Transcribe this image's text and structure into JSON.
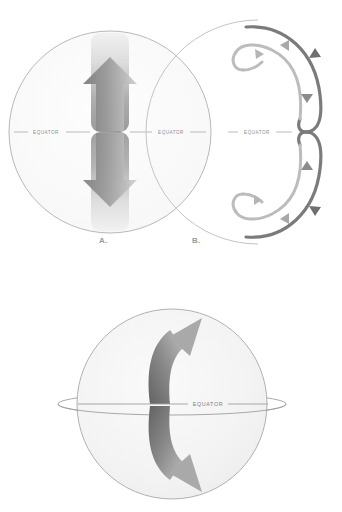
{
  "figure": {
    "background_color": "#ffffff",
    "ink_color": "#9a9a9a",
    "arrow_dark": "#6f6f6f",
    "arrow_light": "#c9c9c9",
    "globe_fill": "#f4f4f4",
    "globe_stroke": "#a8a8a8"
  },
  "panels": [
    {
      "id": "panel-a",
      "letter": "A.",
      "type": "globe-vertical-arrows",
      "labels": {
        "equator_left": "EQUATOR",
        "equator_right": "EQUATOR"
      },
      "arrows": [
        {
          "name": "northward-arrow",
          "direction": "up"
        },
        {
          "name": "southward-arrow",
          "direction": "down"
        }
      ]
    },
    {
      "id": "panel-b",
      "letter": "B.",
      "type": "convection-loops",
      "labels": {
        "equator": "EQUATOR"
      },
      "arrows": [
        {
          "name": "northern-loop-outbound",
          "direction": "right"
        },
        {
          "name": "northern-loop-return",
          "direction": "up"
        },
        {
          "name": "northern-loop-descend",
          "direction": "down"
        },
        {
          "name": "southern-loop-ascend",
          "direction": "up"
        },
        {
          "name": "southern-loop-descend",
          "direction": "down"
        },
        {
          "name": "southern-loop-return",
          "direction": "left"
        }
      ]
    },
    {
      "id": "panel-c",
      "letter": "",
      "type": "globe-curved-arrows",
      "labels": {
        "equator": "EQUATOR"
      },
      "arrows": [
        {
          "name": "northern-curved-arrow",
          "direction": "up-right"
        },
        {
          "name": "southern-curved-arrow",
          "direction": "down-right"
        }
      ]
    }
  ]
}
